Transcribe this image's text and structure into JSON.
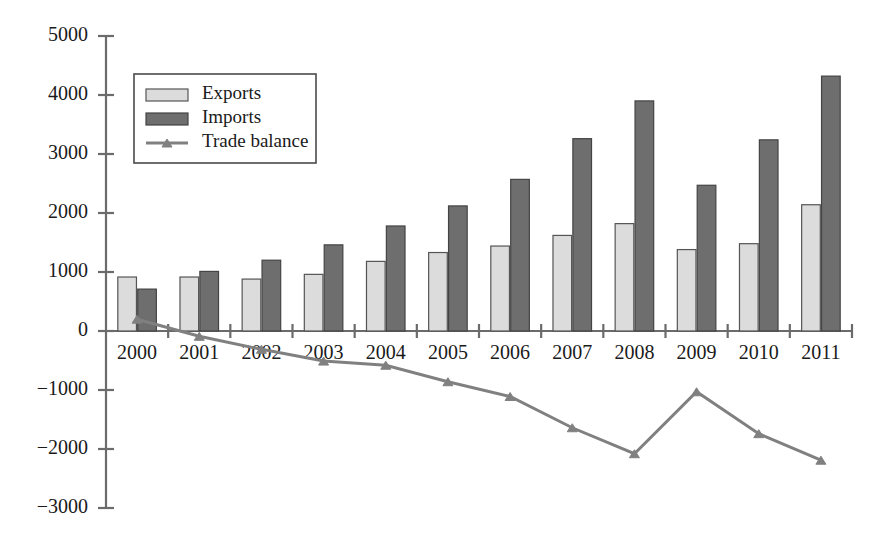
{
  "chart_data": {
    "type": "bar",
    "title": "",
    "subtitle": "",
    "xlabel": "",
    "ylabel": "",
    "categories": [
      "2000",
      "2001",
      "2002",
      "2003",
      "2004",
      "2005",
      "2006",
      "2007",
      "2008",
      "2009",
      "2010",
      "2011"
    ],
    "series": [
      {
        "name": "Exports",
        "type": "bar",
        "color": "#dcdcdc",
        "values": [
          915,
          915,
          880,
          960,
          1180,
          1330,
          1440,
          1620,
          1820,
          1380,
          1480,
          2140
        ]
      },
      {
        "name": "Imports",
        "type": "bar",
        "color": "#6e6e6e",
        "values": [
          710,
          1010,
          1200,
          1460,
          1780,
          2120,
          2570,
          3260,
          3900,
          2470,
          3240,
          4320
        ]
      },
      {
        "name": "Trade balance",
        "type": "line",
        "color": "#808080",
        "values": [
          200,
          -90,
          -310,
          -510,
          -580,
          -860,
          -1110,
          -1640,
          -2080,
          -1030,
          -1740,
          -2190
        ]
      }
    ],
    "ylim": [
      -3000,
      5000
    ],
    "ytick_labels": [
      "5000",
      "4000",
      "3000",
      "2000",
      "1000",
      "0",
      "−1000",
      "−2000",
      "−3000"
    ],
    "ytick_values": [
      5000,
      4000,
      3000,
      2000,
      1000,
      0,
      -1000,
      -2000,
      -3000
    ],
    "grid": false,
    "legend_position": "top-left",
    "legend_entries": [
      "Exports",
      "Imports",
      "Trade balance"
    ]
  },
  "legend": {
    "items": [
      {
        "label": "Exports",
        "icon": "bar-swatch-light"
      },
      {
        "label": "Imports",
        "icon": "bar-swatch-dark"
      },
      {
        "label": "Trade balance",
        "icon": "line-marker"
      }
    ]
  }
}
